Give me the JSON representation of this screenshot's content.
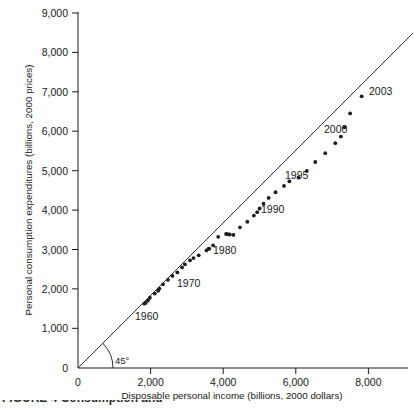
{
  "chart_data": {
    "type": "scatter",
    "title": "",
    "xlabel": "Disposable personal income (billions, 2000 dollars)",
    "ylabel": "Personal consumption expenditures (billions, 2000 prices)",
    "xlim": [
      0,
      8500
    ],
    "ylim": [
      0,
      9000
    ],
    "xticks": [
      0,
      2000,
      4000,
      6000,
      8000
    ],
    "xtick_labels": [
      "0",
      "2,000",
      "4,000",
      "6,000",
      "8,000"
    ],
    "yticks": [
      0,
      1000,
      2000,
      3000,
      4000,
      5000,
      6000,
      7000,
      8000,
      9000
    ],
    "ytick_labels": [
      "0",
      "1,000",
      "2,000",
      "3,000",
      "4,000",
      "5,000",
      "6,000",
      "7,000",
      "8,000",
      "9,000"
    ],
    "grid": false,
    "legend": null,
    "series": [
      {
        "name": "Consumption vs. disposable income",
        "x": [
          1823,
          1864,
          1927,
          1980,
          2115,
          2207,
          2243,
          2342,
          2478,
          2601,
          2738,
          2866,
          2946,
          3086,
          3182,
          3326,
          3538,
          3615,
          3595,
          3722,
          3862,
          4079,
          4116,
          4180,
          4281,
          4462,
          4665,
          4845,
          4937,
          5004,
          5110,
          5252,
          5442,
          5675,
          5823,
          6074,
          6303,
          6536,
          6811,
          7088,
          7242,
          7343,
          7497,
          7814
        ],
        "y": [
          1630,
          1650,
          1711,
          1781,
          1888,
          1958,
          2014,
          2121,
          2235,
          2335,
          2422,
          2549,
          2629,
          2731,
          2786,
          2856,
          2982,
          3026,
          3022,
          3109,
          3325,
          3400,
          3392,
          3385,
          3375,
          3566,
          3708,
          3865,
          3951,
          4044,
          4165,
          4311,
          4456,
          4615,
          4733,
          4825,
          4995,
          5222,
          5447,
          5699,
          5867,
          6101,
          6455,
          6887
        ],
        "marker": "circle",
        "color": "#1c1c1c"
      }
    ],
    "reference_line": {
      "label": "45°",
      "description": "45-degree line through the origin where consumption equals disposable income",
      "slope": 1,
      "intercept": 0
    },
    "annotations": [
      {
        "label": "1960",
        "x": 2130,
        "y": 1270
      },
      {
        "label": "1970",
        "x": 3280,
        "y": 2190
      },
      {
        "label": "1980",
        "x": 4260,
        "y": 3020
      },
      {
        "label": "1990",
        "x": 5560,
        "y": 4065
      },
      {
        "label": "1995",
        "x": 6180,
        "y": 4925
      },
      {
        "label": "2000",
        "x": 7240,
        "y": 6085
      },
      {
        "label": "2003",
        "x": 7920,
        "y": 7060
      }
    ]
  },
  "axis": {
    "x_title": "Disposable personal income (billions, 2000 dollars)",
    "y_title": "Personal consumption expenditures (billions, 2000 prices)",
    "angle_label": "45°",
    "x_labels": [
      "0",
      "2,000",
      "4,000",
      "6,000",
      "8,000"
    ],
    "y_labels": [
      "0",
      "1,000",
      "2,000",
      "3,000",
      "4,000",
      "5,000",
      "6,000",
      "7,000",
      "8,000",
      "9,000"
    ]
  },
  "annotation_labels": {
    "y1960": "1960",
    "y1970": "1970",
    "y1980": "1980",
    "y1990": "1990",
    "y1995": "1995",
    "y2000": "2000",
    "y2003": "2003"
  },
  "caption": {
    "text": "FIGURE 4 Consumption and"
  },
  "colors": {
    "marker": "#1c1c1c",
    "axis": "#1a1a1a",
    "background": "#ffffff"
  }
}
